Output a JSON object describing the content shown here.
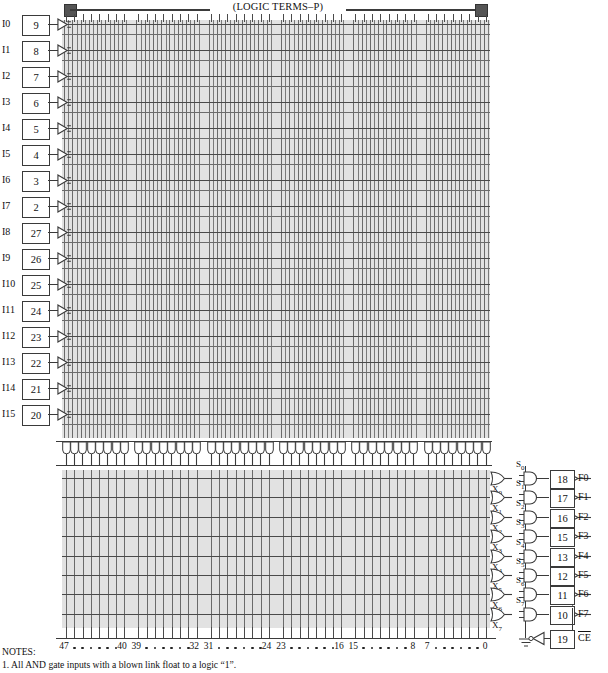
{
  "diagram": {
    "header_label": "(LOGIC TERMS–P)"
  },
  "inputs": [
    {
      "name": "I0",
      "pin": "9"
    },
    {
      "name": "I1",
      "pin": "8"
    },
    {
      "name": "I2",
      "pin": "7"
    },
    {
      "name": "I3",
      "pin": "6"
    },
    {
      "name": "I4",
      "pin": "5"
    },
    {
      "name": "I5",
      "pin": "4"
    },
    {
      "name": "I6",
      "pin": "3"
    },
    {
      "name": "I7",
      "pin": "2"
    },
    {
      "name": "I8",
      "pin": "27"
    },
    {
      "name": "I9",
      "pin": "26"
    },
    {
      "name": "I10",
      "pin": "25"
    },
    {
      "name": "I11",
      "pin": "24"
    },
    {
      "name": "I12",
      "pin": "23"
    },
    {
      "name": "I13",
      "pin": "22"
    },
    {
      "name": "I14",
      "pin": "21"
    },
    {
      "name": "I15",
      "pin": "20"
    }
  ],
  "outputs": [
    {
      "or_term": "X",
      "or_index": "0",
      "sum_term": "S",
      "sum_index": "0",
      "pin": "18",
      "name": "F0"
    },
    {
      "or_term": "X",
      "or_index": "1",
      "sum_term": "S",
      "sum_index": "1",
      "pin": "17",
      "name": "F1"
    },
    {
      "or_term": "X",
      "or_index": "2",
      "sum_term": "S",
      "sum_index": "2",
      "pin": "16",
      "name": "F2"
    },
    {
      "or_term": "X",
      "or_index": "3",
      "sum_term": "S",
      "sum_index": "3",
      "pin": "15",
      "name": "F3"
    },
    {
      "or_term": "X",
      "or_index": "4",
      "sum_term": "S",
      "sum_index": "4",
      "pin": "13",
      "name": "F4"
    },
    {
      "or_term": "X",
      "or_index": "5",
      "sum_term": "S",
      "sum_index": "5",
      "pin": "12",
      "name": "F5"
    },
    {
      "or_term": "X",
      "or_index": "6",
      "sum_term": "S",
      "sum_index": "6",
      "pin": "11",
      "name": "F6"
    },
    {
      "or_term": "X",
      "or_index": "7",
      "sum_term": "S",
      "sum_index": "7",
      "pin": "10",
      "name": "F7"
    }
  ],
  "chip_enable": {
    "pin": "19",
    "name": "CE",
    "overline": true
  },
  "product_terms": {
    "total": 48,
    "groups": 6,
    "per_group": 8,
    "axis_labels": [
      "47",
      "40",
      "39",
      "32",
      "31",
      "24",
      "23",
      "16",
      "15",
      "8",
      "7",
      "0"
    ]
  },
  "notes": {
    "heading": "NOTES:",
    "items": [
      "1.  All AND gate inputs with a blown link float to a logic “1”."
    ]
  },
  "colors": {
    "array_fill": "#e2e2e2",
    "line": "#3a3a3a",
    "grid_line": "#6a6a6a",
    "marker": "#555555"
  }
}
